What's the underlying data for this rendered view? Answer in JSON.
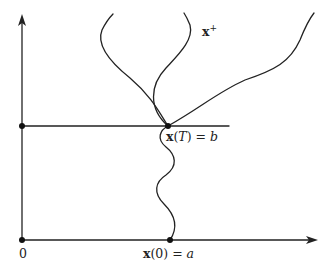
{
  "diagram": {
    "type": "path-diagram",
    "axes": {
      "origin_label": "0",
      "horizontal_arrow": true,
      "vertical_arrow": true
    },
    "points": [
      {
        "id": "origin",
        "label": "0"
      },
      {
        "id": "start",
        "label_bold": "x",
        "label_rest": "(0) = ",
        "label_var": "a"
      },
      {
        "id": "end",
        "label_bold": "x",
        "label_rest": "(",
        "label_var": "T",
        "label_tail": ") = ",
        "label_var2": "b"
      },
      {
        "id": "time-T-axis-mark",
        "label": ""
      }
    ],
    "curve_label": {
      "bold": "x",
      "sup": "+"
    },
    "colors": {
      "stroke": "#222222",
      "background": "#ffffff"
    }
  }
}
